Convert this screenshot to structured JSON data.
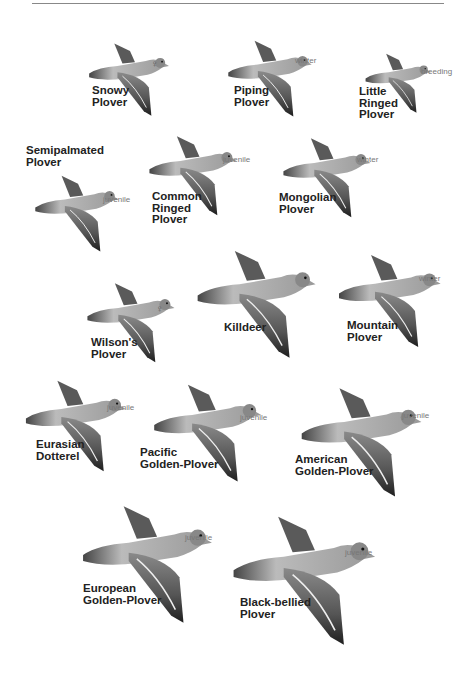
{
  "plate": {
    "species": [
      {
        "id": "snowy",
        "name": "Snowy\nPlover",
        "tag": "♀"
      },
      {
        "id": "piping",
        "name": "Piping\nPlover",
        "tag": "winter"
      },
      {
        "id": "little_ringed",
        "name": "Little\nRinged\nPlover",
        "tag": "breeding"
      },
      {
        "id": "semipalmated",
        "name": "Semipalmated\nPlover",
        "tag": "juvenile"
      },
      {
        "id": "common_ringed",
        "name": "Common\nRinged\nPlover",
        "tag": "juvenile"
      },
      {
        "id": "mongolian",
        "name": "Mongolian\nPlover",
        "tag": "winter"
      },
      {
        "id": "wilsons",
        "name": "Wilson's\nPlover",
        "tag": "♀"
      },
      {
        "id": "killdeer",
        "name": "Killdeer",
        "tag": ""
      },
      {
        "id": "mountain",
        "name": "Mountain\nPlover",
        "tag": "winter"
      },
      {
        "id": "eurasian_dotterel",
        "name": "Eurasian\nDotterel",
        "tag": "juvenile"
      },
      {
        "id": "pacific_golden",
        "name": "Pacific\nGolden-Plover",
        "tag": "juvenile"
      },
      {
        "id": "american_golden",
        "name": "American\nGolden-Plover",
        "tag": "juvenile"
      },
      {
        "id": "european_golden",
        "name": "European\nGolden-Plover",
        "tag": "juvenile"
      },
      {
        "id": "black_bellied",
        "name": "Black-bellied\nPlover",
        "tag": "juvenile"
      }
    ]
  }
}
